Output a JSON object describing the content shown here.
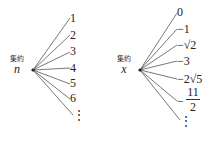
{
  "diagrams": [
    {
      "node_caption": "集約",
      "node_variable": "n",
      "branches": [
        "1",
        "2",
        "3",
        "4",
        "5",
        "6"
      ],
      "continuation": "⋮"
    },
    {
      "node_caption": "集約",
      "node_variable": "x",
      "branches": [
        "0",
        "−1",
        "−√2",
        "−3",
        "−2√5"
      ],
      "fraction_branch": {
        "sign": "−",
        "numerator": "11",
        "denominator": "2"
      },
      "continuation": "⋮"
    }
  ]
}
